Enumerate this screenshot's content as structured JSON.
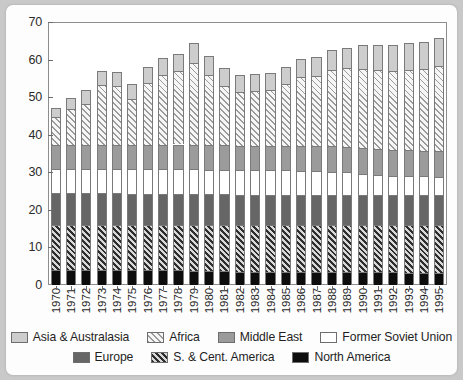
{
  "chart_data": {
    "type": "bar",
    "subtype": "stacked-bar",
    "title": "",
    "xlabel": "",
    "ylabel": "",
    "ylim": [
      0,
      70
    ],
    "yticks": [
      0,
      10,
      20,
      30,
      40,
      50,
      60,
      70
    ],
    "grid": false,
    "legend_position": "bottom",
    "categories": [
      "1970",
      "1971",
      "1972",
      "1973",
      "1974",
      "1975",
      "1976",
      "1977",
      "1978",
      "1979",
      "1980",
      "1981",
      "1982",
      "1983",
      "1984",
      "1985",
      "1986",
      "1987",
      "1988",
      "1989",
      "1990",
      "1991",
      "1992",
      "1993",
      "1994",
      "1995"
    ],
    "series": [
      {
        "name": "North America",
        "color": "#0d0d0d",
        "pattern": "solid",
        "values": [
          4.0,
          4.0,
          4.0,
          4.0,
          4.0,
          3.9,
          3.9,
          3.9,
          3.9,
          3.8,
          3.7,
          3.6,
          3.5,
          3.5,
          3.5,
          3.5,
          3.5,
          3.5,
          3.5,
          3.5,
          3.5,
          3.4,
          3.4,
          3.3,
          3.3,
          3.3
        ]
      },
      {
        "name": "S. & Cent. America",
        "color": "#2e2e2e",
        "pattern": "dense-diagonal-hatch",
        "values": [
          11.9,
          11.9,
          11.9,
          11.9,
          11.9,
          12.0,
          12.0,
          12.0,
          12.1,
          12.1,
          12.2,
          12.3,
          12.4,
          12.4,
          12.4,
          12.4,
          12.4,
          12.4,
          12.4,
          12.4,
          12.4,
          12.5,
          12.5,
          12.6,
          12.6,
          12.6
        ]
      },
      {
        "name": "Europe",
        "color": "#666666",
        "pattern": "solid",
        "values": [
          8.5,
          8.5,
          8.5,
          8.5,
          8.5,
          8.4,
          8.4,
          8.4,
          8.3,
          8.3,
          8.2,
          8.2,
          8.1,
          8.1,
          8.1,
          8.1,
          8.1,
          8.1,
          8.1,
          8.1,
          8.0,
          8.0,
          8.0,
          8.0,
          8.0,
          8.0
        ]
      },
      {
        "name": "Former Soviet Union",
        "color": "#ffffff",
        "pattern": "none",
        "values": [
          6.5,
          6.5,
          6.5,
          6.5,
          6.5,
          6.6,
          6.6,
          6.6,
          6.6,
          6.6,
          6.6,
          6.6,
          6.5,
          6.5,
          6.5,
          6.5,
          6.4,
          6.3,
          6.2,
          6.0,
          5.7,
          5.4,
          5.2,
          5.1,
          5.0,
          4.9
        ]
      },
      {
        "name": "Middle East",
        "color": "#9b9b9b",
        "pattern": "solid",
        "values": [
          6.4,
          6.4,
          6.4,
          6.4,
          6.4,
          6.4,
          6.4,
          6.4,
          6.5,
          6.5,
          6.6,
          6.6,
          6.6,
          6.6,
          6.6,
          6.6,
          6.6,
          6.6,
          6.7,
          6.7,
          6.8,
          6.8,
          6.8,
          6.9,
          6.9,
          6.9
        ]
      },
      {
        "name": "Africa",
        "color": "#9a9a9a",
        "pattern": "light-diagonal-hatch",
        "values": [
          7.5,
          9.5,
          11.0,
          15.9,
          15.6,
          12.3,
          16.6,
          18.7,
          19.6,
          21.9,
          18.7,
          15.8,
          14.3,
          14.5,
          14.8,
          16.3,
          18.4,
          18.8,
          20.4,
          21.0,
          21.1,
          21.2,
          21.1,
          21.4,
          21.6,
          22.5
        ]
      },
      {
        "name": "Asia & Australasia",
        "color": "#cdcdcd",
        "pattern": "solid",
        "values": [
          2.2,
          2.9,
          3.5,
          3.7,
          3.8,
          4.0,
          4.2,
          4.3,
          4.5,
          5.1,
          4.9,
          4.6,
          4.6,
          4.5,
          4.6,
          4.7,
          4.8,
          5.0,
          5.2,
          5.4,
          6.3,
          6.6,
          7.0,
          7.0,
          7.2,
          7.6
        ]
      }
    ],
    "legend": [
      {
        "label": "Asia & Australasia",
        "key": "asia",
        "row": 0
      },
      {
        "label": "Africa",
        "key": "africa",
        "row": 0
      },
      {
        "label": "Middle East",
        "key": "me",
        "row": 0
      },
      {
        "label": "Former Soviet Union",
        "key": "fsu",
        "row": 0
      },
      {
        "label": "Europe",
        "key": "europe",
        "row": 1
      },
      {
        "label": "S. & Cent. America",
        "key": "scam",
        "row": 1
      },
      {
        "label": "North America",
        "key": "na",
        "row": 1
      }
    ]
  }
}
